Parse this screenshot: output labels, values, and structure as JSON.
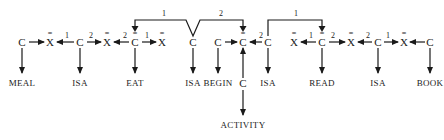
{
  "diagram": {
    "type": "semantic-network",
    "nodes": [
      {
        "id": "n1",
        "symbol": "C",
        "overbar": "",
        "x": 22
      },
      {
        "id": "n2",
        "symbol": "X",
        "overbar": "=",
        "x": 50
      },
      {
        "id": "n3",
        "symbol": "C",
        "overbar": "",
        "x": 80
      },
      {
        "id": "n4",
        "symbol": "X",
        "overbar": "=",
        "x": 107
      },
      {
        "id": "n5",
        "symbol": "C",
        "overbar": "=",
        "x": 135
      },
      {
        "id": "n6",
        "symbol": "X",
        "overbar": "=",
        "x": 162
      },
      {
        "id": "n7",
        "symbol": "C",
        "overbar": "",
        "x": 193
      },
      {
        "id": "n8",
        "symbol": "C",
        "overbar": "",
        "x": 218
      },
      {
        "id": "n9",
        "symbol": "C",
        "overbar": "=",
        "x": 243
      },
      {
        "id": "n10",
        "symbol": "C",
        "overbar": "",
        "x": 268
      },
      {
        "id": "n11",
        "symbol": "X",
        "overbar": "=",
        "x": 294
      },
      {
        "id": "n12",
        "symbol": "C",
        "overbar": "=",
        "x": 322
      },
      {
        "id": "n13",
        "symbol": "X",
        "overbar": "=",
        "x": 351
      },
      {
        "id": "n14",
        "symbol": "C",
        "overbar": "",
        "x": 378
      },
      {
        "id": "n15",
        "symbol": "X",
        "overbar": "=",
        "x": 404
      },
      {
        "id": "n16",
        "symbol": "C",
        "overbar": "",
        "x": 430
      },
      {
        "id": "n17",
        "symbol": "C",
        "overbar": "",
        "x": 243
      }
    ],
    "labels": [
      {
        "text": "MEAL",
        "x": 22
      },
      {
        "text": "ISA",
        "x": 80
      },
      {
        "text": "EAT",
        "x": 135
      },
      {
        "text": "ISA",
        "x": 193
      },
      {
        "text": "BEGIN",
        "x": 218
      },
      {
        "text": "ISA",
        "x": 268
      },
      {
        "text": "READ",
        "x": 322
      },
      {
        "text": "ISA",
        "x": 378
      },
      {
        "text": "BOOK",
        "x": 430
      },
      {
        "text": "ACTIVITY",
        "x": 243
      }
    ],
    "edge_numbers": {
      "n3_n2": "1",
      "n3_n4": "2",
      "n5_n4": "2",
      "n5_n6": "1",
      "n10_n9": "2",
      "n12_n11": "1",
      "n12_n13": "2",
      "n14_n13": "2",
      "n14_n15": "1",
      "bracket_left": "1",
      "bracket_right": "2",
      "bracket_read": "1"
    }
  }
}
